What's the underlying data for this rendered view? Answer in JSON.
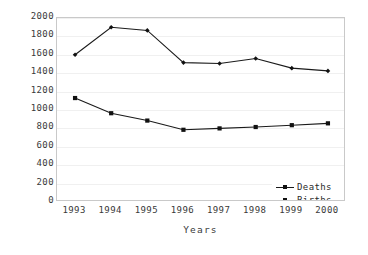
{
  "chart_data": {
    "type": "line",
    "title": "",
    "xlabel": "Years",
    "ylabel": "",
    "categories": [
      "1993",
      "1994",
      "1995",
      "1996",
      "1997",
      "1998",
      "1999",
      "2000"
    ],
    "series": [
      {
        "name": "Deaths",
        "values": [
          1600,
          1900,
          1865,
          1515,
          1505,
          1560,
          1455,
          1425
        ],
        "color": "#1a1a1a",
        "marker": "diamond"
      },
      {
        "name": "Births",
        "values": [
          1130,
          965,
          885,
          785,
          800,
          815,
          835,
          855
        ],
        "color": "#111111",
        "marker": "square"
      }
    ],
    "ylim": [
      0,
      2000
    ],
    "ytick_labels": [
      "2000",
      "1800",
      "1600",
      "1400",
      "1200",
      "1000",
      "800",
      "600",
      "400",
      "200",
      "0"
    ],
    "ytick_values": [
      2000,
      1800,
      1600,
      1400,
      1200,
      1000,
      800,
      600,
      400,
      200,
      0
    ],
    "grid": true,
    "grid_color": "#f0f0f0",
    "legend_position": "lower-right-inside",
    "legend_entries": [
      "Deaths",
      "Births"
    ],
    "plot_border_color": "#c9c9c9",
    "background_color": "#ffffff"
  }
}
